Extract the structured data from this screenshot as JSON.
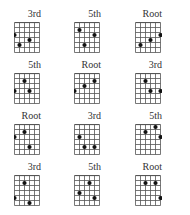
{
  "figure": {
    "rows": 4,
    "cols": 3,
    "strings": 6,
    "frets": 6,
    "colors": {
      "line": "#555555",
      "dot": "#111111",
      "text": "#333333"
    },
    "diagrams": [
      {
        "label": "3rd",
        "dots": [
          [
            0,
            3
          ],
          [
            1,
            5
          ],
          [
            3,
            4
          ]
        ]
      },
      {
        "label": "5th",
        "dots": [
          [
            1,
            2
          ],
          [
            4,
            3
          ],
          [
            2,
            5
          ]
        ]
      },
      {
        "label": "Root",
        "dots": [
          [
            1,
            5
          ],
          [
            3,
            4
          ],
          [
            5,
            3
          ]
        ]
      },
      {
        "label": "5th",
        "dots": [
          [
            2,
            2
          ],
          [
            0,
            4
          ],
          [
            3,
            4
          ]
        ]
      },
      {
        "label": "Root",
        "dots": [
          [
            0,
            4
          ],
          [
            2,
            3
          ],
          [
            4,
            2
          ]
        ]
      },
      {
        "label": "3rd",
        "dots": [
          [
            2,
            2
          ],
          [
            3,
            4
          ],
          [
            5,
            4
          ]
        ]
      },
      {
        "label": "Root",
        "dots": [
          [
            0,
            3
          ],
          [
            2,
            2
          ],
          [
            3,
            5
          ]
        ]
      },
      {
        "label": "3rd",
        "dots": [
          [
            1,
            3
          ],
          [
            2,
            5
          ],
          [
            4,
            5
          ]
        ]
      },
      {
        "label": "5th",
        "dots": [
          [
            2,
            2
          ],
          [
            4,
            1
          ],
          [
            5,
            3
          ]
        ]
      },
      {
        "label": "3rd",
        "dots": [
          [
            2,
            2
          ],
          [
            0,
            5
          ],
          [
            3,
            6
          ]
        ]
      },
      {
        "label": "5th",
        "dots": [
          [
            3,
            2
          ],
          [
            1,
            4
          ],
          [
            4,
            5
          ]
        ]
      },
      {
        "label": "Root",
        "dots": [
          [
            2,
            2
          ],
          [
            4,
            2
          ],
          [
            5,
            5
          ]
        ]
      }
    ]
  }
}
